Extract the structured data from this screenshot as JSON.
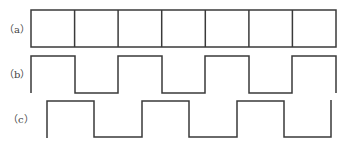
{
  "figure": {
    "background": "#ffffff",
    "stroke_color": "#3a3a3a",
    "stroke_width": 1.5,
    "rows": [
      {
        "id": "a",
        "label": "（a）",
        "label_pos": {
          "x": 4,
          "y": 24
        },
        "type": "grid",
        "x_start": 31,
        "x_end": 336,
        "y_top": 10,
        "y_bottom": 47,
        "dividers": [
          74.6,
          118.1,
          161.7,
          205.3,
          248.9,
          292.4
        ]
      },
      {
        "id": "b",
        "label": "（b）",
        "label_pos": {
          "x": 4,
          "y": 69
        },
        "type": "square-wave",
        "y_high": 56,
        "y_low": 93,
        "points": [
          [
            31,
            93
          ],
          [
            31,
            56
          ],
          [
            75,
            56
          ],
          [
            75,
            93
          ],
          [
            118,
            93
          ],
          [
            118,
            56
          ],
          [
            162,
            56
          ],
          [
            162,
            93
          ],
          [
            205,
            93
          ],
          [
            205,
            56
          ],
          [
            249,
            56
          ],
          [
            249,
            93
          ],
          [
            292,
            93
          ],
          [
            292,
            56
          ],
          [
            336,
            56
          ],
          [
            336,
            93
          ]
        ]
      },
      {
        "id": "c",
        "label": "（c）",
        "label_pos": {
          "x": 8,
          "y": 114
        },
        "type": "square-wave",
        "y_high": 101,
        "y_low": 137,
        "points": [
          [
            47,
            138
          ],
          [
            47,
            101
          ],
          [
            94,
            101
          ],
          [
            94,
            137
          ],
          [
            142,
            137
          ],
          [
            142,
            101
          ],
          [
            189,
            101
          ],
          [
            189,
            137
          ],
          [
            237,
            137
          ],
          [
            237,
            101
          ],
          [
            284,
            101
          ],
          [
            284,
            137
          ],
          [
            331,
            137
          ],
          [
            331,
            100
          ]
        ]
      }
    ]
  }
}
